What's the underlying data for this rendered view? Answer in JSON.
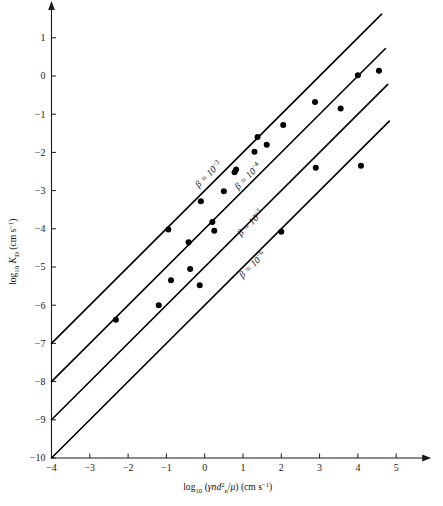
{
  "chart_data": {
    "type": "scatter",
    "title": "",
    "subtitle": "",
    "xlabel": "log₁₀ (γnd²ₙ/μ) (cm s⁻¹)",
    "ylabel": "log₁₀ K_D (cm s⁻¹)",
    "xlabel_parts": {
      "prefix": "log",
      "prefix_sub": "10",
      "open": " (",
      "gamma": "γ",
      "n": "n",
      "d": "d",
      "d_sup": "2",
      "d_sub": "n",
      "slash": "/",
      "mu": "μ",
      "close": ") (cm s",
      "units_sup": "−1",
      "tail": ")"
    },
    "ylabel_parts": {
      "prefix": "log",
      "prefix_sub": "10",
      "k": "K",
      "k_sub": "D",
      "units": " (cm s",
      "units_sup": "−1",
      "tail": ")"
    },
    "xlim": [
      -4,
      5.6
    ],
    "ylim": [
      -10,
      1.6
    ],
    "xticks": [
      -4,
      -3,
      -2,
      -1,
      0,
      1,
      2,
      3,
      4,
      5
    ],
    "xticklabels": [
      "−4",
      "−3",
      "−2",
      "−1",
      "0",
      "1",
      "2",
      "3",
      "4",
      "5"
    ],
    "yticks": [
      1,
      0,
      -1,
      -2,
      -3,
      -4,
      -5,
      -6,
      -7,
      -8,
      -9,
      -10
    ],
    "yticklabels": [
      "1",
      "0",
      "−1",
      "−2",
      "−3",
      "−4",
      "−5",
      "−6",
      "−7",
      "−8",
      "−9",
      "−10"
    ],
    "grid": false,
    "legend_position": "inline-annotations",
    "axis_style": "arrow-ended-open-axes",
    "marker": {
      "shape": "circle",
      "color": "#000000",
      "size_px": 5.2
    },
    "reference_lines": [
      {
        "name": "beta-1e-3",
        "label": "β = 10⁻³",
        "label_mantissa": "β = 10",
        "label_exponent": "−3",
        "slope": 1,
        "intercept_at_x_minus4": -7,
        "x_start": -4,
        "y_start": -7,
        "x_end": 4.62,
        "y_end": 1.62,
        "label_x": 0.15,
        "label_y": -2.63
      },
      {
        "name": "beta-1e-4",
        "label": "β = 10⁻⁴",
        "label_mantissa": "β = 10",
        "label_exponent": "−4",
        "slope": 1,
        "intercept_at_x_minus4": -8,
        "x_start": -4,
        "y_start": -8,
        "x_end": 4.72,
        "y_end": 0.72,
        "label_x": 1.18,
        "label_y": -2.68
      },
      {
        "name": "beta-1e-5",
        "label": "β = 10⁻⁵",
        "label_mantissa": "β = 10",
        "label_exponent": "−5",
        "slope": 1,
        "intercept_at_x_minus4": -9,
        "x_start": -4,
        "y_start": -9,
        "x_end": 4.78,
        "y_end": -0.22,
        "label_x": 1.25,
        "label_y": -3.9
      },
      {
        "name": "beta-1e-6",
        "label": "β = 10⁻⁶",
        "label_mantissa": "β = 10",
        "label_exponent": "−6",
        "slope": 1,
        "intercept_at_x_minus4": -10,
        "x_start": -4,
        "y_start": -10,
        "x_end": 4.82,
        "y_end": -1.18,
        "label_x": 1.3,
        "label_y": -5.0
      }
    ],
    "points": [
      {
        "x": -2.32,
        "y": -6.38
      },
      {
        "x": -1.2,
        "y": -6.0
      },
      {
        "x": -0.95,
        "y": -4.02
      },
      {
        "x": -0.88,
        "y": -5.35
      },
      {
        "x": -0.42,
        "y": -4.35
      },
      {
        "x": -0.38,
        "y": -5.05
      },
      {
        "x": -0.13,
        "y": -5.48
      },
      {
        "x": -0.1,
        "y": -3.28
      },
      {
        "x": 0.2,
        "y": -3.82
      },
      {
        "x": 0.25,
        "y": -4.05
      },
      {
        "x": 0.5,
        "y": -3.02
      },
      {
        "x": 0.78,
        "y": -2.52
      },
      {
        "x": 0.82,
        "y": -2.45
      },
      {
        "x": 1.3,
        "y": -1.98
      },
      {
        "x": 1.38,
        "y": -1.6
      },
      {
        "x": 1.62,
        "y": -1.8
      },
      {
        "x": 2.0,
        "y": -4.08
      },
      {
        "x": 2.05,
        "y": -1.28
      },
      {
        "x": 2.88,
        "y": -0.68
      },
      {
        "x": 2.9,
        "y": -2.4
      },
      {
        "x": 3.55,
        "y": -0.85
      },
      {
        "x": 4.0,
        "y": 0.02
      },
      {
        "x": 4.08,
        "y": -2.35
      },
      {
        "x": 4.55,
        "y": 0.14
      }
    ]
  },
  "colors": {
    "background": "#ffffff",
    "ink": "#111111",
    "line": "#000000",
    "marker": "#000000"
  }
}
